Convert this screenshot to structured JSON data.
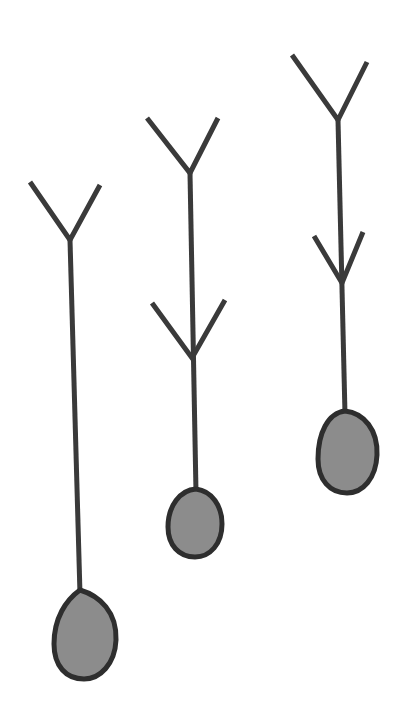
{
  "colors": {
    "background": "#ffffff",
    "stroke": "#3a3a3a",
    "bulb_fill": "#8c8c8c",
    "bulb_outline": "#2e2e2e"
  },
  "figures": [
    {
      "id": "figure-left",
      "branches": 1,
      "top_y": {
        "left_arm": [
          30,
          182
        ],
        "right_arm": [
          100,
          185
        ],
        "junction": [
          70,
          240
        ]
      },
      "stem": {
        "from": [
          70,
          240
        ],
        "to": [
          80,
          592
        ]
      },
      "bulb": {
        "cx": 85,
        "cy": 634,
        "rx": 30,
        "ry": 45
      }
    },
    {
      "id": "figure-middle",
      "branches": 2,
      "top_y": {
        "left_arm": [
          147,
          118
        ],
        "right_arm": [
          218,
          118
        ],
        "junction": [
          190,
          173
        ]
      },
      "lower_y": {
        "left_arm": [
          152,
          303
        ],
        "right_arm": [
          225,
          300
        ],
        "junction": [
          192,
          358
        ]
      },
      "stem": {
        "from": [
          190,
          173
        ],
        "to": [
          196,
          490
        ]
      },
      "bulb": {
        "cx": 195,
        "cy": 523,
        "rx": 27,
        "ry": 35
      }
    },
    {
      "id": "figure-right",
      "branches": 2,
      "top_y": {
        "left_arm": [
          292,
          55
        ],
        "right_arm": [
          367,
          62
        ],
        "junction": [
          338,
          120
        ]
      },
      "lower_y": {
        "left_arm": [
          314,
          236
        ],
        "right_arm": [
          363,
          232
        ],
        "junction": [
          342,
          283
        ]
      },
      "stem": {
        "from": [
          338,
          120
        ],
        "to": [
          345,
          412
        ]
      },
      "bulb": {
        "cx": 348,
        "cy": 452,
        "rx": 30,
        "ry": 41
      }
    }
  ]
}
